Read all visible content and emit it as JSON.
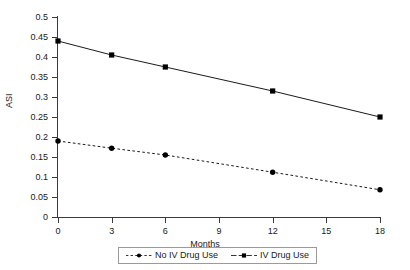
{
  "chart_data": {
    "type": "line",
    "title": "",
    "xlabel": "Months",
    "ylabel": "ASI",
    "x": [
      0,
      3,
      6,
      12,
      18
    ],
    "xlim": [
      0,
      18
    ],
    "ylim": [
      0,
      0.5
    ],
    "grid": false,
    "legend_position": "bottom-center",
    "xticks": [
      "0",
      "3",
      "6",
      "9",
      "12",
      "15",
      "18"
    ],
    "xtick_values": [
      0,
      3,
      6,
      9,
      12,
      15,
      18
    ],
    "yticks": [
      "0",
      "0.05",
      "0.1",
      "0.15",
      "0.2",
      "0.25",
      "0.3",
      "0.35",
      "0.4",
      "0.45",
      "0.5"
    ],
    "ytick_values": [
      0,
      0.05,
      0.1,
      0.15,
      0.2,
      0.25,
      0.3,
      0.35,
      0.4,
      0.45,
      0.5
    ],
    "series": [
      {
        "name": "No IV Drug Use",
        "values": [
          0.19,
          0.172,
          0.155,
          0.112,
          0.068
        ],
        "style": "dashed",
        "marker": "circle",
        "color": "#000000"
      },
      {
        "name": "IV Drug Use",
        "values": [
          0.44,
          0.405,
          0.375,
          0.315,
          0.25
        ],
        "style": "solid",
        "marker": "square",
        "color": "#000000"
      }
    ]
  },
  "axes": {
    "y_title": "ASI",
    "x_title": "Months"
  },
  "legend": {
    "entries": [
      {
        "label": "No IV Drug Use"
      },
      {
        "label": "IV Drug Use"
      }
    ]
  },
  "colors": {
    "axis": "#3a3a3a",
    "series_1": "#000000",
    "series_2": "#000000",
    "legend_border": "#9a9a9a",
    "background": "#ffffff"
  }
}
